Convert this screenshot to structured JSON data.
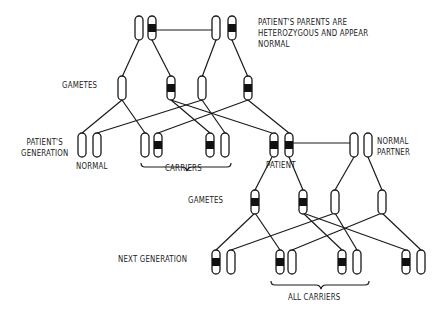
{
  "diagram": {
    "labels": {
      "parents_note_line1": "PATIENT'S PARENTS ARE",
      "parents_note_line2": "HETEROZYGOUS AND APPEAR",
      "parents_note_line3": "NORMAL",
      "gametes_1": "GAMETES",
      "patients_generation_line1": "PATIENT'S",
      "patients_generation_line2": "GENERATION",
      "normal": "NORMAL",
      "carriers": "CARRIERS",
      "patient": "PATIENT",
      "normal_partner_line1": "NORMAL",
      "normal_partner_line2": "PARTNER",
      "gametes_2": "GAMETES",
      "next_generation": "NEXT GENERATION",
      "all_carriers": "ALL CARRIERS"
    },
    "generations": [
      {
        "name": "Parents",
        "members": [
          {
            "id": "parent-1",
            "chromosomes": [
              "normal",
              "affected"
            ]
          },
          {
            "id": "parent-2",
            "chromosomes": [
              "normal",
              "affected"
            ]
          }
        ]
      },
      {
        "name": "Gametes",
        "members": [
          "normal",
          "affected",
          "normal",
          "affected"
        ]
      },
      {
        "name": "Patient's generation",
        "members": [
          {
            "id": "normal",
            "chromosomes": [
              "normal",
              "normal"
            ]
          },
          {
            "id": "carrier-1",
            "chromosomes": [
              "normal",
              "affected"
            ]
          },
          {
            "id": "carrier-2",
            "chromosomes": [
              "affected",
              "normal"
            ]
          },
          {
            "id": "patient",
            "chromosomes": [
              "affected",
              "affected"
            ]
          },
          {
            "id": "normal-partner",
            "chromosomes": [
              "normal",
              "normal"
            ]
          }
        ]
      },
      {
        "name": "Gametes",
        "members": [
          "affected",
          "affected",
          "normal",
          "normal"
        ]
      },
      {
        "name": "Next generation",
        "members": [
          {
            "id": "child-1",
            "chromosomes": [
              "affected",
              "normal"
            ]
          },
          {
            "id": "child-2",
            "chromosomes": [
              "affected",
              "normal"
            ]
          },
          {
            "id": "child-3",
            "chromosomes": [
              "affected",
              "normal"
            ]
          },
          {
            "id": "child-4",
            "chromosomes": [
              "affected",
              "normal"
            ]
          }
        ]
      }
    ]
  }
}
